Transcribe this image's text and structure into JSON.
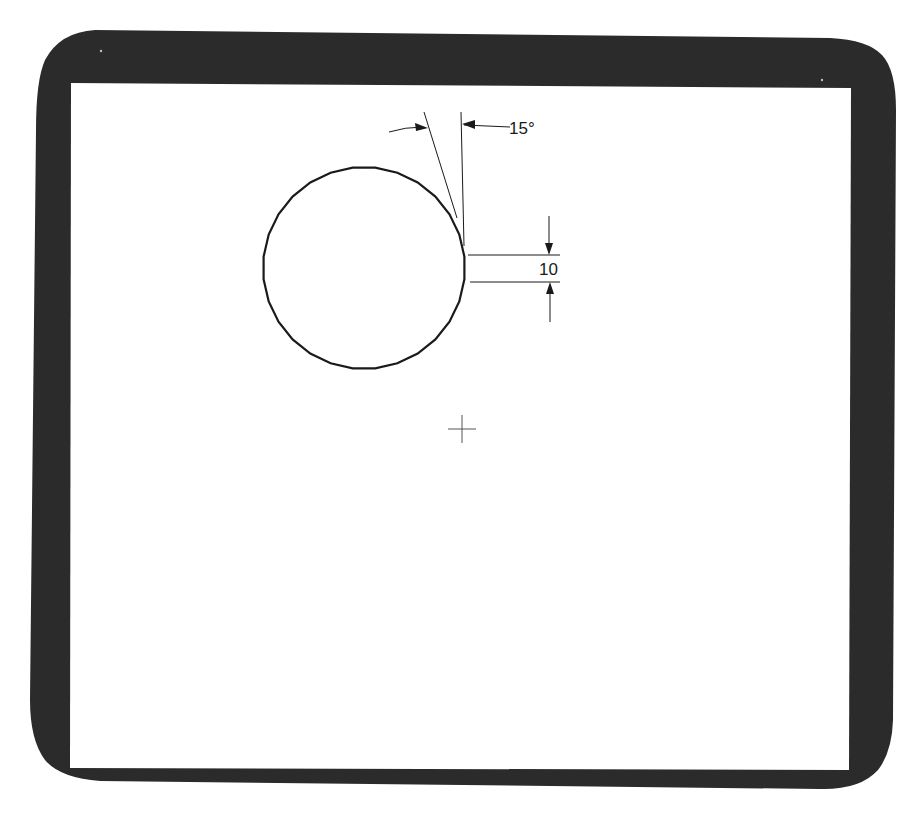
{
  "screen": {
    "bezel_color": "#2b2b2b",
    "screen_color": "#ffffff",
    "line_color": "#1a1a1a"
  },
  "drawing": {
    "circle": {
      "cx": 364,
      "cy": 268,
      "r": 101,
      "segments": 28
    },
    "angle_dimension": {
      "label": "15°",
      "value_deg": 15
    },
    "linear_dimension": {
      "label": "10",
      "value": 10
    },
    "cursor": {
      "x": 462,
      "y": 429,
      "shape": "crosshair"
    }
  }
}
